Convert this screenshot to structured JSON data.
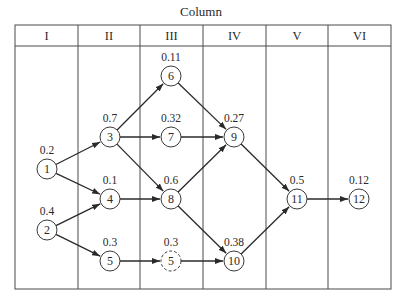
{
  "title": "Column",
  "columns": [
    "I",
    "II",
    "III",
    "IV",
    "V",
    "VI"
  ],
  "nodes": [
    {
      "id": "1",
      "label": "1",
      "value": "0.2",
      "col": "I",
      "x": 47,
      "y": 169,
      "dashed": false
    },
    {
      "id": "2",
      "label": "2",
      "value": "0.4",
      "col": "I",
      "x": 47,
      "y": 230,
      "dashed": false
    },
    {
      "id": "3",
      "label": "3",
      "value": "0.7",
      "col": "II",
      "x": 110,
      "y": 137,
      "dashed": false
    },
    {
      "id": "4",
      "label": "4",
      "value": "0.1",
      "col": "II",
      "x": 110,
      "y": 199,
      "dashed": false
    },
    {
      "id": "5",
      "label": "5",
      "value": "0.3",
      "col": "II",
      "x": 110,
      "y": 261,
      "dashed": false
    },
    {
      "id": "6",
      "label": "6",
      "value": "0.11",
      "col": "III",
      "x": 171,
      "y": 76,
      "dashed": false
    },
    {
      "id": "7",
      "label": "7",
      "value": "0.32",
      "col": "III",
      "x": 171,
      "y": 137,
      "dashed": false
    },
    {
      "id": "8",
      "label": "8",
      "value": "0.6",
      "col": "III",
      "x": 171,
      "y": 199,
      "dashed": false
    },
    {
      "id": "5d",
      "label": "5",
      "value": "0.3",
      "col": "III",
      "x": 171,
      "y": 261,
      "dashed": true
    },
    {
      "id": "9",
      "label": "9",
      "value": "0.27",
      "col": "IV",
      "x": 234,
      "y": 137,
      "dashed": false
    },
    {
      "id": "10",
      "label": "10",
      "value": "0.38",
      "col": "IV",
      "x": 234,
      "y": 261,
      "dashed": false
    },
    {
      "id": "11",
      "label": "11",
      "value": "0.5",
      "col": "V",
      "x": 297,
      "y": 199,
      "dashed": false
    },
    {
      "id": "12",
      "label": "12",
      "value": "0.12",
      "col": "VI",
      "x": 359,
      "y": 199,
      "dashed": false
    }
  ],
  "edges": [
    {
      "from": "1",
      "to": "3"
    },
    {
      "from": "1",
      "to": "4"
    },
    {
      "from": "2",
      "to": "4"
    },
    {
      "from": "2",
      "to": "5"
    },
    {
      "from": "3",
      "to": "6"
    },
    {
      "from": "3",
      "to": "7"
    },
    {
      "from": "3",
      "to": "8"
    },
    {
      "from": "4",
      "to": "8"
    },
    {
      "from": "5",
      "to": "5d"
    },
    {
      "from": "6",
      "to": "9"
    },
    {
      "from": "7",
      "to": "9"
    },
    {
      "from": "8",
      "to": "9"
    },
    {
      "from": "8",
      "to": "10"
    },
    {
      "from": "5d",
      "to": "10"
    },
    {
      "from": "9",
      "to": "11"
    },
    {
      "from": "10",
      "to": "11"
    },
    {
      "from": "11",
      "to": "12"
    }
  ],
  "colors": {
    "line": "#3a3a3a",
    "text": "#2a2a2a",
    "background": "#ffffff"
  }
}
